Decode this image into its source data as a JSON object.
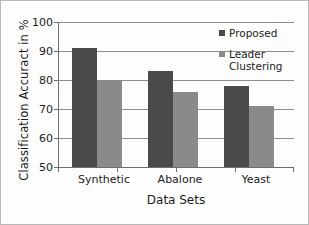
{
  "chart_data": {
    "type": "bar",
    "title": "",
    "subtitle": "",
    "categories": [
      "Synthetic",
      "Abalone",
      "Yeast"
    ],
    "series": [
      {
        "name": "Proposed",
        "values": [
          91,
          83,
          78
        ],
        "color": "#4a4a4a"
      },
      {
        "name": "Leader Clustering",
        "values": [
          80,
          76,
          71
        ],
        "color": "#8a8a8a"
      }
    ],
    "xlabel": "Data Sets",
    "ylabel": "Classification Accuract in %",
    "ylim": [
      50,
      100
    ],
    "yticks": [
      50,
      60,
      70,
      80,
      90,
      100
    ],
    "ytick_labels": [
      "50",
      "60",
      "70",
      "80",
      "90",
      "100"
    ],
    "grid": true,
    "grid_axis": "y",
    "legend": true,
    "legend_position": "top-right-inside",
    "annotations": []
  },
  "legend": {
    "entries": [
      {
        "label": "Proposed",
        "swatch_color": "#4a4a4a"
      },
      {
        "label": "Leader\nClustering",
        "swatch_color": "#8a8a8a"
      }
    ]
  },
  "axes": {
    "y_title": "Classification Accuract in %",
    "x_title": "Data Sets",
    "y_ticks": [
      "100",
      "90",
      "80",
      "70",
      "60",
      "50"
    ],
    "x_ticks": [
      "Synthetic",
      "Abalone",
      "Yeast"
    ]
  },
  "colors": {
    "series_proposed": "#4a4a4a",
    "series_leader": "#8a8a8a",
    "gridline": "#8f8f8f",
    "axis": "#6d6d6d",
    "text": "#1c1c1c",
    "background": "#fdfdfd",
    "border": "#b9b9b9"
  }
}
